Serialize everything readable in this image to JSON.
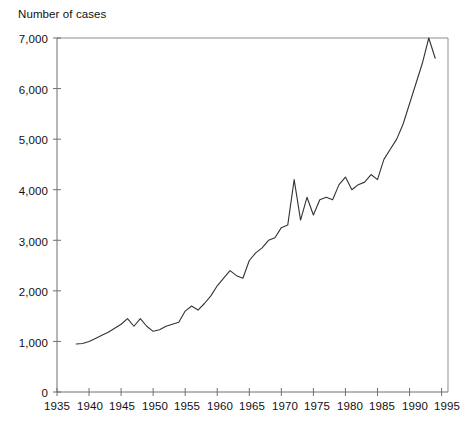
{
  "chart_data": {
    "type": "line",
    "title": "",
    "xlabel": "",
    "ylabel": "Number of cases",
    "ylabel_position": "top-left",
    "grid": false,
    "legend": false,
    "xlim": [
      1935,
      1996
    ],
    "ylim": [
      0,
      7000
    ],
    "xticks": [
      "1935",
      "1940",
      "1945",
      "1950",
      "1955",
      "1960",
      "1965",
      "1970",
      "1975",
      "1980",
      "1985",
      "1990",
      "1995"
    ],
    "yticks": [
      "0",
      "1,000",
      "2,000",
      "3,000",
      "4,000",
      "5,000",
      "6,000",
      "7,000"
    ],
    "line_color": "#333333",
    "frame_color": "#888888",
    "series": [
      {
        "name": "Number of cases",
        "x": [
          1938,
          1939,
          1940,
          1941,
          1942,
          1943,
          1944,
          1945,
          1946,
          1947,
          1948,
          1949,
          1950,
          1951,
          1952,
          1953,
          1954,
          1955,
          1956,
          1957,
          1958,
          1959,
          1960,
          1961,
          1962,
          1963,
          1964,
          1965,
          1966,
          1967,
          1968,
          1969,
          1970,
          1971,
          1972,
          1973,
          1974,
          1975,
          1976,
          1977,
          1978,
          1979,
          1980,
          1981,
          1982,
          1983,
          1984,
          1985,
          1986,
          1987,
          1988,
          1989,
          1990,
          1991,
          1992,
          1993,
          1994
        ],
        "values": [
          950,
          960,
          1000,
          1060,
          1120,
          1180,
          1260,
          1340,
          1450,
          1300,
          1450,
          1300,
          1200,
          1230,
          1300,
          1340,
          1380,
          1600,
          1700,
          1620,
          1750,
          1900,
          2100,
          2250,
          2400,
          2300,
          2250,
          2600,
          2750,
          2850,
          3000,
          3050,
          3250,
          3300,
          4200,
          3400,
          3850,
          3500,
          3800,
          3850,
          3800,
          4100,
          4250,
          4000,
          4100,
          4150,
          4300,
          4200,
          4600,
          4800,
          5000,
          5300,
          5700,
          6100,
          6500,
          7000,
          6600
        ]
      }
    ]
  }
}
